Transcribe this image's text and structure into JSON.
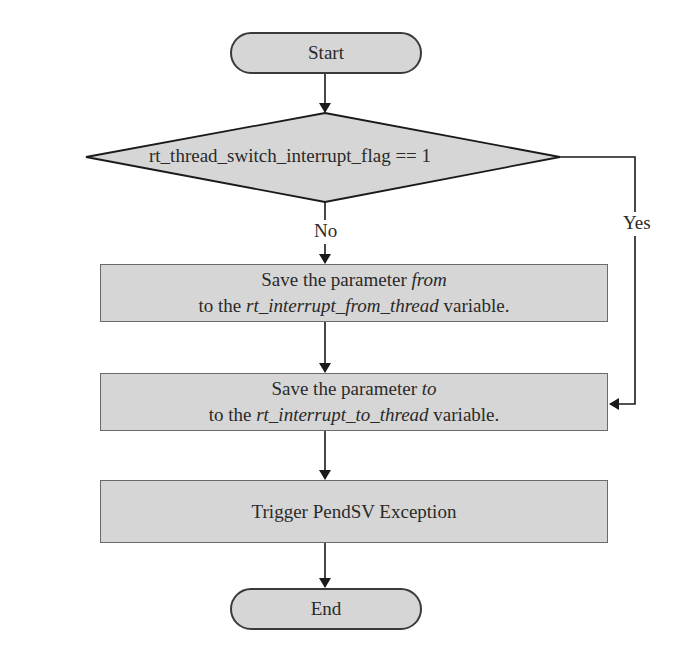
{
  "flowchart": {
    "start": {
      "label": "Start"
    },
    "decision": {
      "label": "rt_thread_switch_interrupt_flag == 1"
    },
    "branches": {
      "no": "No",
      "yes": "Yes"
    },
    "step1": {
      "line1_prefix": "Save the parameter ",
      "line1_italic": "from",
      "line2_prefix": "to the ",
      "line2_italic": "rt_interrupt_from_thread",
      "line2_suffix": " variable."
    },
    "step2": {
      "line1_prefix": "Save the parameter ",
      "line1_italic": "to",
      "line2_prefix": "to the ",
      "line2_italic": "rt_interrupt_to_thread",
      "line2_suffix": " variable."
    },
    "step3": {
      "label": "Trigger PendSV Exception"
    },
    "end": {
      "label": "End"
    }
  },
  "colors": {
    "node_fill": "#d6d6d6",
    "stroke": "#2a2a2a",
    "background": "#ffffff"
  }
}
